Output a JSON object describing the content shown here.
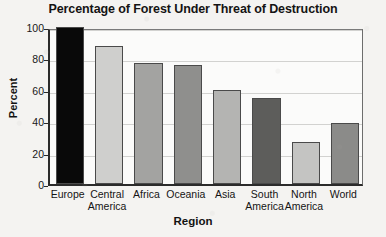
{
  "chart_data": {
    "type": "bar",
    "title": "Percentage of Forest Under Threat of Destruction",
    "xlabel": "Region",
    "ylabel": "Percent",
    "categories": [
      "Europe",
      "Central America",
      "Africa",
      "Oceania",
      "Asia",
      "South America",
      "North America",
      "World"
    ],
    "values": [
      100,
      88,
      77,
      76,
      60,
      55,
      27,
      39
    ],
    "ylim": [
      0,
      100
    ],
    "yticks": [
      0,
      20,
      40,
      60,
      80,
      100
    ],
    "ytick_labels": [
      "0",
      "20",
      "40",
      "60",
      "80",
      "100"
    ],
    "grid": true,
    "legend": false,
    "bar_colors": [
      "#090909",
      "#cfcfcd",
      "#a3a3a1",
      "#8f8f8d",
      "#b4b4b2",
      "#5d5d5b",
      "#c4c4c2",
      "#8b8b89"
    ],
    "bar_edge_color": "#4a4a4a",
    "axis_color": "#2b2b2b",
    "gridline_color": "#d2d2d0",
    "plot_background": "#fbfbfa",
    "page_background": "#f4f3f1"
  },
  "xtick_display": [
    "Europe",
    "Central\nAmerica",
    "Africa",
    "Oceania",
    "Asia",
    "South\nAmerica",
    "North\nAmerica",
    "World"
  ]
}
